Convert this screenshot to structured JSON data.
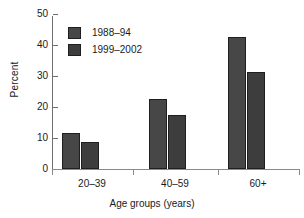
{
  "chart_data": {
    "type": "bar",
    "title": "",
    "subtitle": "",
    "xlabel": "Age groups (years)",
    "ylabel": "Percent",
    "categories": [
      "20–39",
      "40–59",
      "60+"
    ],
    "series": [
      {
        "name": "1988–94",
        "values": [
          11.5,
          22.5,
          42.5
        ],
        "color": "#474747"
      },
      {
        "name": "1999–2002",
        "values": [
          8.8,
          17.5,
          31.3
        ],
        "color": "#3d3d3d"
      }
    ],
    "ylim": [
      0,
      50
    ],
    "yticks": [
      0,
      10,
      20,
      30,
      40,
      50
    ],
    "ytick_labels": [
      "0",
      "10",
      "20",
      "30",
      "40",
      "50"
    ],
    "grid": false,
    "legend_position": "upper-left-inside"
  },
  "legend": {
    "entries": [
      {
        "label": "1988–94"
      },
      {
        "label": "1999–2002"
      }
    ]
  },
  "axes": {
    "y_title": "Percent",
    "x_title": "Age groups (years)"
  }
}
